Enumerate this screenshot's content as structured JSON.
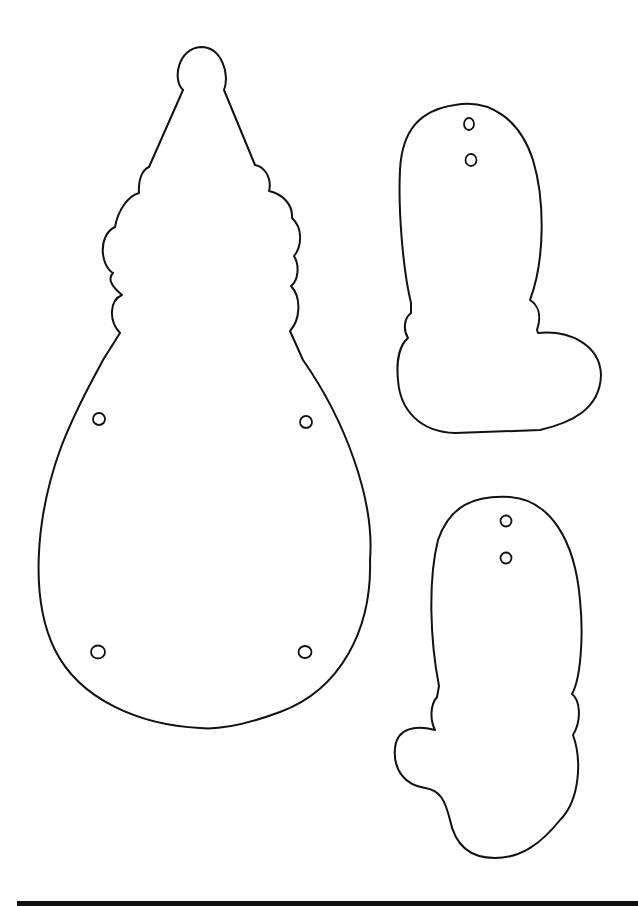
{
  "page": {
    "background": "#ffffff",
    "line_color": "#111111"
  },
  "shapes": [
    {
      "name": "gnome-body-with-hat",
      "holes": 4
    },
    {
      "name": "boot",
      "holes": 2
    },
    {
      "name": "mitten",
      "holes": 2
    }
  ],
  "footer": {
    "rule": "bottom-border"
  }
}
